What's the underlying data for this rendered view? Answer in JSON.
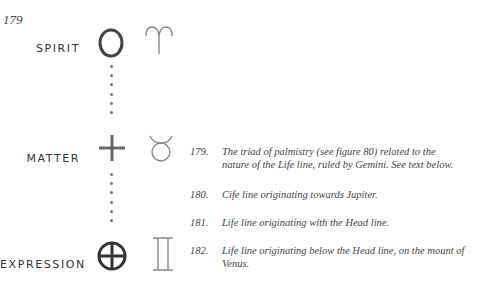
{
  "figure": {
    "number": "179",
    "rows": [
      {
        "label": "SPIRIT",
        "symbol": "circle-icon",
        "sign": "aries-icon"
      },
      {
        "label": "MATTER",
        "symbol": "cross-icon",
        "sign": "taurus-icon"
      },
      {
        "label": "EXPRESSION",
        "symbol": "circled-cross-icon",
        "sign": "gemini-icon"
      }
    ]
  },
  "captions": [
    {
      "num": "179.",
      "line1": "The triad of palmistry (see figure 80) related to the",
      "line2": "nature of the Life line, ruled by Gemini. See text below."
    },
    {
      "num": "180.",
      "line1": "Cife line originating towards Jupiter."
    },
    {
      "num": "181.",
      "line1": "Life line originating with the Head line."
    },
    {
      "num": "182.",
      "line1": "Life line originating below the Head line, on the mount of",
      "line2": "Venus."
    }
  ],
  "colors": {
    "ink": "#3a3a3a",
    "symbol": "#555555",
    "sign": "#888888"
  }
}
